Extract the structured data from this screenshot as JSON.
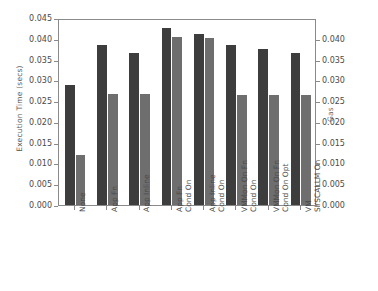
{
  "chart_data": {
    "type": "bar",
    "title": "",
    "xlabel": "",
    "ylabel": "Execution Time (secs)",
    "y2label": "Gas",
    "grid": false,
    "legend": "none",
    "categories": [
      "None",
      "App Fn",
      "App Inline",
      "App Fn\nCond On",
      "App Inline\nCond On",
      "VMMon On Fn\nCond On",
      "VMMon On Fn\nCond On Opt",
      "VM\nSYSCALLM On"
    ],
    "series": [
      {
        "name": "Execution Time (secs)",
        "axis": "left",
        "color": "#3d3d3d",
        "values": [
          0.0288,
          0.0384,
          0.0367,
          0.0426,
          0.0411,
          0.0385,
          0.0375,
          0.0367
        ]
      },
      {
        "name": "Gas",
        "axis": "right",
        "color": "#6e6e6e",
        "values": [
          0.012,
          0.0268,
          0.0266,
          0.0404,
          0.0401,
          0.0265,
          0.0265,
          0.0264
        ]
      }
    ],
    "ylim": [
      0.0,
      0.045
    ],
    "y2lim": [
      0.0,
      0.045
    ],
    "yticks": [
      "0.000",
      "0.005",
      "0.010",
      "0.015",
      "0.020",
      "0.025",
      "0.030",
      "0.035",
      "0.040",
      "0.045"
    ],
    "ytick_values": [
      0.0,
      0.005,
      0.01,
      0.015,
      0.02,
      0.025,
      0.03,
      0.035,
      0.04,
      0.045
    ],
    "y2ticks": [
      "0.000",
      "0.005",
      "0.010",
      "0.015",
      "0.020",
      "0.025",
      "0.030",
      "0.035",
      "0.040"
    ],
    "y2tick_values": [
      0.0,
      0.005,
      0.01,
      0.015,
      0.02,
      0.025,
      0.03,
      0.035,
      0.04
    ],
    "colors": {
      "execution_time_bar": "#3d3d3d",
      "gas_bar": "#6e6e6e",
      "axis": "#8a8a8a",
      "text": "#4a4a4a",
      "background": "#ffffff"
    }
  }
}
